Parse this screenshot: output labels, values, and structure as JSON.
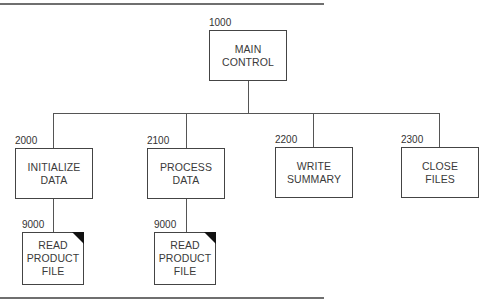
{
  "diagram": {
    "type": "structure-chart",
    "root": {
      "id": "1000",
      "label_lines": [
        "MAIN",
        "CONTROL"
      ]
    },
    "children": [
      {
        "id": "2000",
        "label_lines": [
          "INITIALIZE",
          "DATA"
        ],
        "children": [
          {
            "id": "9000",
            "label_lines": [
              "READ",
              "PRODUCT",
              "FILE"
            ],
            "predefined": true
          }
        ]
      },
      {
        "id": "2100",
        "label_lines": [
          "PROCESS",
          "DATA"
        ],
        "children": [
          {
            "id": "9000",
            "label_lines": [
              "READ",
              "PRODUCT",
              "FILE"
            ],
            "predefined": true
          }
        ]
      },
      {
        "id": "2200",
        "label_lines": [
          "WRITE",
          "SUMMARY"
        ]
      },
      {
        "id": "2300",
        "label_lines": [
          "CLOSE",
          "FILES"
        ]
      }
    ]
  },
  "colors": {
    "line": "#555555",
    "rule": "#6f6f6f",
    "corner_marker": "#111111"
  }
}
